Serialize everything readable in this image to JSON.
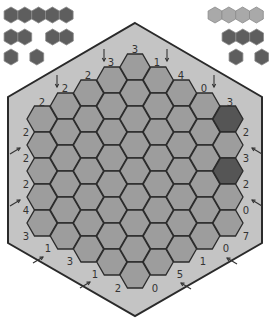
{
  "colors": {
    "background": "#ffffff",
    "board_fill": "#c4c4c4",
    "board_stroke": "#2a2a2a",
    "cell_fill": "#9d9d9d",
    "cell_stroke": "#2b2b2b",
    "cell_dark": "#555555",
    "legend_dark": "#5e5e5e",
    "legend_light": "#a9a9a9",
    "legend_stroke": "#8a8a8a",
    "clue_text": "#333333",
    "arrow": "#333333"
  },
  "board": {
    "side": 5,
    "columns": 9,
    "column_lengths": [
      5,
      6,
      7,
      8,
      9,
      8,
      7,
      6,
      5
    ],
    "outline": [
      [
        135,
        23
      ],
      [
        262,
        97
      ],
      [
        262,
        243
      ],
      [
        135,
        316
      ],
      [
        8,
        243
      ],
      [
        8,
        97
      ]
    ],
    "dark_cells": [
      {
        "col": 8,
        "row": 0
      },
      {
        "col": 8,
        "row": 2
      }
    ]
  },
  "legend_left": {
    "rows": [
      {
        "groups": [
          5
        ],
        "y": 15,
        "x": 11
      },
      {
        "groups": [
          2,
          2
        ],
        "y": 37,
        "x": 11,
        "gap": 14
      },
      {
        "groups": [
          1,
          1
        ],
        "y": 57,
        "x": 11,
        "gap": 12
      }
    ],
    "color": "dark"
  },
  "legend_right": {
    "rows": [
      {
        "groups": [
          4
        ],
        "y": 15,
        "x": 215,
        "color": "light"
      },
      {
        "groups": [
          3
        ],
        "y": 37,
        "x": 229,
        "color": "dark"
      },
      {
        "groups": [
          1,
          1
        ],
        "y": 57,
        "x": 236,
        "gap": 12,
        "color": "dark"
      }
    ]
  },
  "clues": [
    {
      "text": "3",
      "x": 135,
      "y": 50,
      "arrow": null
    },
    {
      "text": "3",
      "x": 111,
      "y": 63,
      "arrow": "down",
      "ax": 104,
      "ay": 55
    },
    {
      "text": "1",
      "x": 157,
      "y": 63,
      "arrow": "down",
      "ax": 167,
      "ay": 55
    },
    {
      "text": "2",
      "x": 88,
      "y": 76,
      "arrow": null
    },
    {
      "text": "4",
      "x": 181,
      "y": 76,
      "arrow": null
    },
    {
      "text": "2",
      "x": 65,
      "y": 89,
      "arrow": "down",
      "ax": 57,
      "ay": 81
    },
    {
      "text": "0",
      "x": 204,
      "y": 89,
      "arrow": "down",
      "ax": 214,
      "ay": 81
    },
    {
      "text": "2",
      "x": 42,
      "y": 103,
      "arrow": null
    },
    {
      "text": "3",
      "x": 230,
      "y": 103,
      "arrow": null
    },
    {
      "text": "2",
      "x": 26,
      "y": 133,
      "arrow": null
    },
    {
      "text": "2",
      "x": 246,
      "y": 133,
      "arrow": null
    },
    {
      "text": "2",
      "x": 26,
      "y": 159,
      "arrow": "upright",
      "ax": 15,
      "ay": 150
    },
    {
      "text": "3",
      "x": 246,
      "y": 159,
      "arrow": "upleft",
      "ax": 257,
      "ay": 150
    },
    {
      "text": "2",
      "x": 26,
      "y": 185,
      "arrow": null
    },
    {
      "text": "2",
      "x": 246,
      "y": 185,
      "arrow": null
    },
    {
      "text": "4",
      "x": 26,
      "y": 211,
      "arrow": "upright",
      "ax": 15,
      "ay": 202
    },
    {
      "text": "0",
      "x": 246,
      "y": 211,
      "arrow": "upleft",
      "ax": 257,
      "ay": 202
    },
    {
      "text": "3",
      "x": 26,
      "y": 237,
      "arrow": null
    },
    {
      "text": "7",
      "x": 246,
      "y": 237,
      "arrow": null
    },
    {
      "text": "1",
      "x": 48,
      "y": 249,
      "arrow": "upright",
      "ax": 38,
      "ay": 259
    },
    {
      "text": "0",
      "x": 226,
      "y": 249,
      "arrow": "upleft",
      "ax": 232,
      "ay": 260
    },
    {
      "text": "3",
      "x": 70,
      "y": 262,
      "arrow": null
    },
    {
      "text": "1",
      "x": 203,
      "y": 262,
      "arrow": null
    },
    {
      "text": "1",
      "x": 95,
      "y": 275,
      "arrow": "upright",
      "ax": 85,
      "ay": 284
    },
    {
      "text": "5",
      "x": 180,
      "y": 275,
      "arrow": "upleft",
      "ax": 186,
      "ay": 285
    },
    {
      "text": "2",
      "x": 118,
      "y": 289,
      "arrow": null
    },
    {
      "text": "0",
      "x": 155,
      "y": 289,
      "arrow": null
    }
  ]
}
